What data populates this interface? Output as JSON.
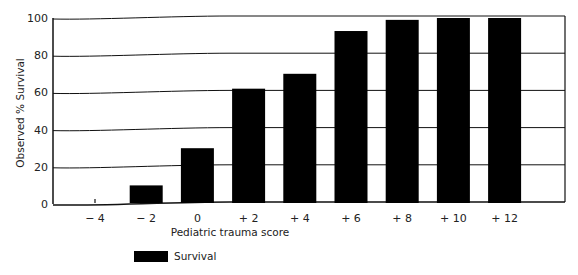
{
  "chart_data": {
    "type": "bar",
    "title": "",
    "xlabel": "Pediatric trauma score",
    "ylabel": "Observed % Survival",
    "categories": [
      "− 4",
      "− 2",
      "0",
      "+ 2",
      "+ 4",
      "+ 6",
      "+ 8",
      "+ 10",
      "+ 12"
    ],
    "series": [
      {
        "name": "Survival",
        "values": [
          0,
          10,
          30,
          62,
          70,
          93,
          99,
          100,
          100
        ],
        "color": "#000000"
      }
    ],
    "yticks": [
      "0",
      "20",
      "40",
      "60",
      "80",
      "100"
    ],
    "ylim": [
      0,
      100
    ],
    "grid": true,
    "legend_position": "bottom-left"
  },
  "legend": {
    "label": "Survival"
  }
}
